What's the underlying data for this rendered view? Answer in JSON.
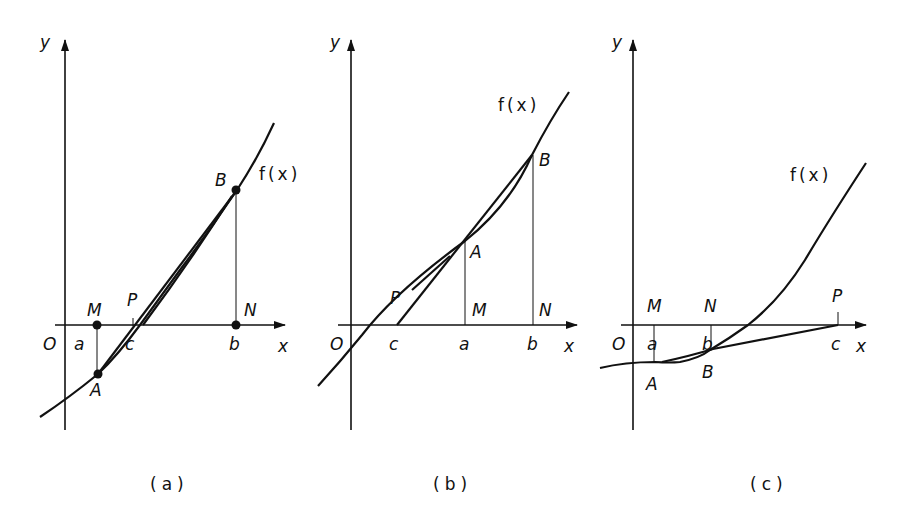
{
  "figure": {
    "panels": [
      {
        "caption": "(a)",
        "axis_labels": {
          "x": "x",
          "y": "y",
          "origin": "O"
        },
        "curve_label": "f(x)",
        "points": {
          "A": "A",
          "B": "B",
          "M": "M",
          "N": "N",
          "P": "P"
        },
        "ticks": {
          "a": "a",
          "b": "b",
          "c": "c"
        }
      },
      {
        "caption": "(b)",
        "axis_labels": {
          "x": "x",
          "y": "y",
          "origin": "O"
        },
        "curve_label": "f(x)",
        "points": {
          "A": "A",
          "B": "B",
          "M": "M",
          "N": "N",
          "P": "P"
        },
        "ticks": {
          "a": "a",
          "b": "b",
          "c": "c"
        }
      },
      {
        "caption": "(c)",
        "axis_labels": {
          "x": "x",
          "y": "y",
          "origin": "O"
        },
        "curve_label": "f(x)",
        "points": {
          "A": "A",
          "B": "B",
          "M": "M",
          "N": "N",
          "P": "P"
        },
        "ticks": {
          "a": "a",
          "b": "b",
          "c": "c"
        }
      }
    ]
  }
}
